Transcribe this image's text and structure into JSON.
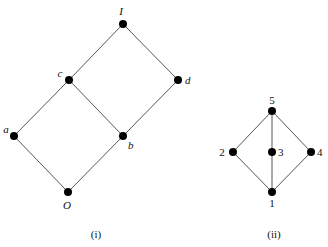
{
  "diagrams": [
    {
      "id": "i",
      "caption": "(i)",
      "caption_pos": [
        96,
        238
      ],
      "italic_labels": true,
      "nodes": [
        {
          "id": "I",
          "label": "I",
          "x": 123,
          "y": 24,
          "lx": 121,
          "ly": 15,
          "anchor": "middle"
        },
        {
          "id": "c",
          "label": "c",
          "x": 69,
          "y": 80,
          "lx": 60,
          "ly": 77,
          "anchor": "middle"
        },
        {
          "id": "d",
          "label": "d",
          "x": 178,
          "y": 80,
          "lx": 185,
          "ly": 84,
          "anchor": "start"
        },
        {
          "id": "a",
          "label": "a",
          "x": 14,
          "y": 136,
          "lx": 6,
          "ly": 133,
          "anchor": "middle"
        },
        {
          "id": "b",
          "label": "b",
          "x": 123,
          "y": 136,
          "lx": 128,
          "ly": 149,
          "anchor": "start"
        },
        {
          "id": "O",
          "label": "O",
          "x": 68,
          "y": 192,
          "lx": 67,
          "ly": 209,
          "anchor": "middle"
        }
      ],
      "edges": [
        [
          "I",
          "c"
        ],
        [
          "I",
          "d"
        ],
        [
          "c",
          "a"
        ],
        [
          "c",
          "b"
        ],
        [
          "d",
          "b"
        ],
        [
          "a",
          "O"
        ],
        [
          "b",
          "O"
        ]
      ]
    },
    {
      "id": "ii",
      "caption": "(ii)",
      "caption_pos": [
        274,
        238
      ],
      "italic_labels": false,
      "nodes": [
        {
          "id": "5",
          "label": "5",
          "x": 272,
          "y": 111,
          "lx": 272,
          "ly": 104,
          "anchor": "middle"
        },
        {
          "id": "2",
          "label": "2",
          "x": 233,
          "y": 152,
          "lx": 222,
          "ly": 156,
          "anchor": "middle"
        },
        {
          "id": "3",
          "label": "3",
          "x": 272,
          "y": 152,
          "lx": 278,
          "ly": 156,
          "anchor": "start"
        },
        {
          "id": "4",
          "label": "4",
          "x": 311,
          "y": 152,
          "lx": 317,
          "ly": 156,
          "anchor": "start"
        },
        {
          "id": "1",
          "label": "1",
          "x": 272,
          "y": 192,
          "lx": 272,
          "ly": 207,
          "anchor": "middle"
        }
      ],
      "edges": [
        [
          "5",
          "2"
        ],
        [
          "5",
          "3"
        ],
        [
          "5",
          "4"
        ],
        [
          "2",
          "1"
        ],
        [
          "3",
          "1"
        ],
        [
          "4",
          "1"
        ]
      ]
    }
  ],
  "style": {
    "node_radius": 4,
    "node_color": "#000000",
    "edge_color": "#555555"
  }
}
